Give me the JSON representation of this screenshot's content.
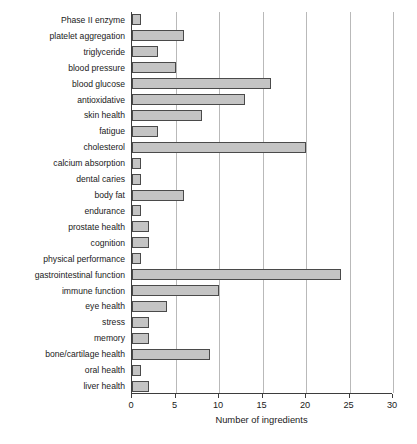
{
  "chart_data": {
    "type": "bar",
    "orientation": "horizontal",
    "title": "",
    "xlabel": "Number of ingredients",
    "ylabel": "",
    "xlim": [
      0,
      30
    ],
    "xticks": [
      0,
      5,
      10,
      15,
      20,
      25,
      30
    ],
    "grid": "vertical",
    "legend": "none",
    "bar_color": "#c4c4c4",
    "bar_edge_color": "#4a4a4a",
    "axis_color": "#3d3d3d",
    "gridline_color": "#b9b9b9",
    "categories": [
      "Phase II enzyme",
      "platelet aggregation",
      "triglyceride",
      "blood pressure",
      "blood glucose",
      "antioxidative",
      "skin health",
      "fatigue",
      "cholesterol",
      "calcium absorption",
      "dental caries",
      "body fat",
      "endurance",
      "prostate health",
      "cognition",
      "physical performance",
      "gastrointestinal function",
      "immune function",
      "eye health",
      "stress",
      "memory",
      "bone/cartilage health",
      "oral health",
      "liver health"
    ],
    "values": [
      1,
      6,
      3,
      5,
      16,
      13,
      8,
      3,
      20,
      1,
      1,
      6,
      1,
      2,
      2,
      1,
      24,
      10,
      4,
      2,
      2,
      9,
      1,
      2
    ]
  }
}
